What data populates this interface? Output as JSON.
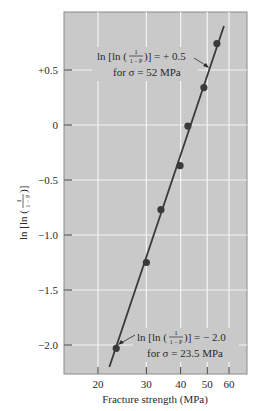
{
  "chart_data": {
    "type": "scatter",
    "title": "",
    "xlabel": "Fracture strength (MPa)",
    "ylabel": "ln [ln ( 1/(1 − P) )]",
    "xscale": "log",
    "xlim": [
      17,
      68
    ],
    "ylim": [
      -2.25,
      0.95
    ],
    "x_ticks": [
      20,
      30,
      40,
      50,
      60
    ],
    "x_tick_labels": [
      "20",
      "30",
      "40",
      "50",
      "60"
    ],
    "y_ticks": [
      0.5,
      0,
      -0.5,
      -1.0,
      -1.5,
      -2.0
    ],
    "y_tick_labels": [
      "+0.5",
      "0",
      "−0.5",
      "−1.0",
      "−1.5",
      "−2.0"
    ],
    "grid": true,
    "legend": null,
    "series": [
      {
        "name": "measured",
        "x": [
          23.3,
          30.0,
          33.9,
          39.8,
          42.5,
          48.6,
          54.2
        ],
        "y": [
          -2.03,
          -1.25,
          -0.77,
          -0.37,
          -0.01,
          0.34,
          0.74
        ]
      }
    ],
    "fit_line": {
      "x": [
        22.0,
        57.5
      ],
      "y": [
        -2.2,
        0.9
      ]
    },
    "annotations": [
      {
        "line1_prefix": "ln [ln (",
        "frac_num": "1",
        "frac_den": "1 − P",
        "line1_suffix": ")] = + 0.5",
        "line2": "for σ = 52 MPa",
        "points_to": {
          "x": 52,
          "y": 0.5
        }
      },
      {
        "line1_prefix": "ln [ln (",
        "frac_num": "1",
        "frac_den": "1 − P",
        "line1_suffix": ")] = − 2.0",
        "line2": "for σ = 23.5 MPa",
        "points_to": {
          "x": 23.5,
          "y": -2.0
        }
      }
    ],
    "colors": {
      "plot_background": "#c9c9c9",
      "grid": "#f4f4f4",
      "line": "#3a3a3a",
      "points": "#3a3a3a",
      "frame": "#8a8a8a"
    }
  },
  "ylabel_parts": {
    "prefix": "ln [ln (",
    "num": "1",
    "den": "1 − P",
    "suffix": ")]"
  }
}
